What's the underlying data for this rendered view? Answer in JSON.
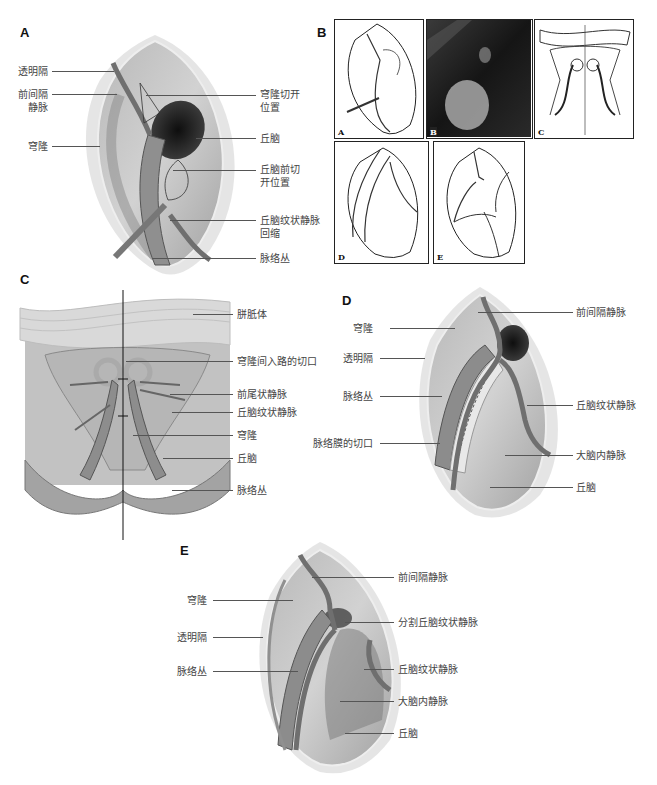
{
  "panels": {
    "A": {
      "letter": "A",
      "labels_left": [
        "透明隔",
        "前间隔\n静脉",
        "穹隆"
      ],
      "labels_right": [
        "穹隆切开\n位置",
        "丘脑",
        "丘脑前切\n开位置",
        "丘脑纹状静脉\n回缩",
        "脉络丛"
      ]
    },
    "B": {
      "letter": "B",
      "thumbnails": [
        {
          "letter": "A",
          "kind": "sketch"
        },
        {
          "letter": "B",
          "kind": "endoscopic-photo"
        },
        {
          "letter": "C",
          "kind": "sketch"
        },
        {
          "letter": "D",
          "kind": "sketch"
        },
        {
          "letter": "E",
          "kind": "sketch"
        }
      ]
    },
    "C": {
      "letter": "C",
      "labels_right": [
        "胼胝体",
        "穹隆间入路的切口",
        "前尾状静脉",
        "丘脑纹状静脉",
        "穹隆",
        "丘脑",
        "脉络丛"
      ]
    },
    "D": {
      "letter": "D",
      "labels_left": [
        "穹隆",
        "透明隔",
        "脉络丛",
        "脉络膜的切口"
      ],
      "labels_right": [
        "前间隔静脉",
        "丘脑纹状静脉",
        "大脑内静脉",
        "丘脑"
      ]
    },
    "E": {
      "letter": "E",
      "labels_left": [
        "穹隆",
        "透明隔",
        "脉络丛"
      ],
      "labels_right": [
        "前间隔静脉",
        "分割丘脑纹状静脉",
        "丘脑纹状静脉",
        "大脑内静脉",
        "丘脑"
      ]
    }
  },
  "colors": {
    "tissue_light": "#c9c9c9",
    "tissue_mid": "#9a9a9a",
    "tissue_dark": "#5e5e5e",
    "foramen": "#1e1e1e",
    "vein": "#7a7a7a",
    "leader_line": "#555555"
  }
}
